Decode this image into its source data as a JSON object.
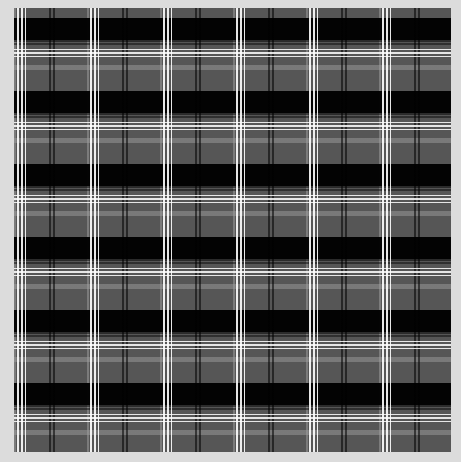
{
  "image": {
    "subject": "tartan-plaid-pattern",
    "palette": {
      "background": "#dcdcdc",
      "base_gray": "#565656",
      "black_band": "#000000",
      "light_band": "#969696",
      "white_line": "#ffffff"
    },
    "tile_size_px": 73,
    "repeats_x": 6,
    "repeats_y": 6
  }
}
